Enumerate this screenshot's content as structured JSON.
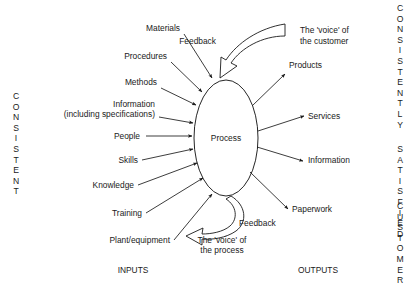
{
  "diagram": {
    "center": {
      "label": "Process"
    },
    "section_labels": {
      "inputs": "INPUTS",
      "outputs": "OUTPUTS"
    },
    "inputs": [
      {
        "label": "Materials",
        "tx": 180,
        "ty": 31,
        "x1": 184,
        "y1": 34,
        "x2": 212,
        "y2": 78,
        "anchor": "end"
      },
      {
        "label": "Procedures",
        "tx": 167,
        "ty": 59,
        "x1": 171,
        "y1": 62,
        "x2": 202,
        "y2": 92,
        "anchor": "end"
      },
      {
        "label": "Methods",
        "tx": 157,
        "ty": 85,
        "x1": 161,
        "y1": 88,
        "x2": 196,
        "y2": 105,
        "anchor": "end"
      },
      {
        "label": "Information",
        "tx": 155,
        "ty": 107,
        "x1": 0,
        "y1": 0,
        "x2": 0,
        "y2": 0,
        "anchor": "end"
      },
      {
        "label": "(including specifications)",
        "tx": 155,
        "ty": 117,
        "x1": 159,
        "y1": 117,
        "x2": 193,
        "y2": 123,
        "anchor": "end"
      },
      {
        "label": "People",
        "tx": 140,
        "ty": 139,
        "x1": 146,
        "y1": 136,
        "x2": 192,
        "y2": 136,
        "anchor": "end"
      },
      {
        "label": "Skills",
        "tx": 138,
        "ty": 163,
        "x1": 142,
        "y1": 160,
        "x2": 193,
        "y2": 149,
        "anchor": "end"
      },
      {
        "label": "Knowledge",
        "tx": 134,
        "ty": 188,
        "x1": 138,
        "y1": 185,
        "x2": 197,
        "y2": 163,
        "anchor": "end"
      },
      {
        "label": "Training",
        "tx": 142,
        "ty": 216,
        "x1": 146,
        "y1": 213,
        "x2": 203,
        "y2": 178,
        "anchor": "end"
      },
      {
        "label": "Plant/equipment",
        "tx": 170,
        "ty": 243,
        "x1": 174,
        "y1": 240,
        "x2": 212,
        "y2": 194,
        "anchor": "end"
      }
    ],
    "outputs": [
      {
        "label": "Products",
        "tx": 289,
        "ty": 68,
        "x1": 252,
        "y1": 106,
        "x2": 285,
        "y2": 74
      },
      {
        "label": "Services",
        "tx": 308,
        "ty": 119,
        "x1": 258,
        "y1": 131,
        "x2": 304,
        "y2": 116
      },
      {
        "label": "Information",
        "tx": 308,
        "ty": 163,
        "x1": 257,
        "y1": 147,
        "x2": 303,
        "y2": 161
      },
      {
        "label": "Paperwork",
        "tx": 292,
        "ty": 212,
        "x1": 250,
        "y1": 172,
        "x2": 288,
        "y2": 209
      }
    ],
    "feedback_top": {
      "label": "Feedback",
      "label_x": 216,
      "label_y": 44,
      "voice_line1": "The 'voice' of",
      "voice_line2": "the customer",
      "voice_x": 300,
      "voice_y1": 33,
      "voice_y2": 44
    },
    "feedback_bottom": {
      "label": "Feedback",
      "label_x": 239,
      "label_y": 226,
      "voice_line1": "The 'voice' of",
      "voice_line2": "the process",
      "voice_x": 181,
      "voice_y1": 243,
      "voice_y2": 253
    },
    "side_text": {
      "left": {
        "text": "CONSISTENT",
        "x": 16,
        "y_start": 99,
        "spacing": 10.6
      },
      "right_groups": [
        {
          "text": "CONSISTENTLY",
          "x": 400,
          "y_start": 11,
          "spacing": 10.6
        },
        {
          "text": "SATISFIED",
          "x": 400,
          "y_start": 152,
          "spacing": 10.6
        },
        {
          "text": "CUSTOMER",
          "x": 400,
          "y_start": 209,
          "spacing": 10.6
        }
      ]
    },
    "colors": {
      "ink": "#1a1a1a",
      "background": "#ffffff"
    }
  }
}
